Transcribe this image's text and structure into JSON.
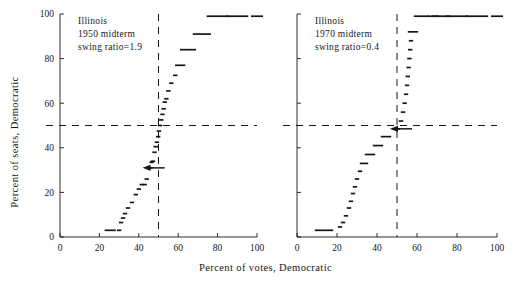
{
  "figure": {
    "xlabel": "Percent of votes, Democratic",
    "ylabel": "Percent of seats, Democratic",
    "ink_color": "#16161a",
    "background": "#ffffff"
  },
  "chart_data": [
    {
      "type": "scatter",
      "panel": "left",
      "title": "Illinois",
      "annotations": [
        "Illinois",
        "1950 midterm",
        "swing ratio=1.9"
      ],
      "xlabel": "Percent of votes, Democratic",
      "ylabel": "Percent of seats, Democratic",
      "xlim": [
        0,
        100
      ],
      "ylim": [
        0,
        100
      ],
      "xticks": [
        0,
        20,
        40,
        60,
        80,
        100
      ],
      "yticks": [
        0,
        20,
        40,
        60,
        80,
        100
      ],
      "grid": false,
      "legend": "none",
      "reference_lines": [
        {
          "orientation": "vertical",
          "value": 50,
          "style": "dashed"
        },
        {
          "orientation": "horizontal",
          "value": 50,
          "style": "dashed"
        }
      ],
      "marker_arrow": {
        "x": 45.5,
        "y": 31,
        "direction": "horizontal"
      },
      "x": [
        25.5,
        30.0,
        31.0,
        32.0,
        33.0,
        34.5,
        36.5,
        38.5,
        40.0,
        41.5,
        43.0,
        44.0,
        45.0,
        45.8,
        46.5,
        47.2,
        48.0,
        48.6,
        49.2,
        49.8,
        50.2,
        50.8,
        51.4,
        52.0,
        52.6,
        53.2,
        54.0,
        55.0,
        56.5,
        58.5,
        61.0,
        65.0,
        72.0,
        80.0,
        90.0,
        100.0
      ],
      "y": [
        3.0,
        3.0,
        6.5,
        8.5,
        10.5,
        13.0,
        15.5,
        19.0,
        21.5,
        23.5,
        23.5,
        26.0,
        31.0,
        31.0,
        33.5,
        34.0,
        38.0,
        40.5,
        42.5,
        45.0,
        47.5,
        50.0,
        52.5,
        55.0,
        57.5,
        60.5,
        62.0,
        65.5,
        69.0,
        72.5,
        77.0,
        84.0,
        91.0,
        99.0,
        99.0,
        99.0
      ]
    },
    {
      "type": "scatter",
      "panel": "right",
      "title": "Illinois",
      "annotations": [
        "Illinois",
        "1970 midterm",
        "swing ratio=0.4"
      ],
      "xlabel": "Percent of votes, Democratic",
      "ylabel": "Percent of seats, Democratic",
      "xlim": [
        0,
        100
      ],
      "ylim": [
        0,
        100
      ],
      "xticks": [
        0,
        20,
        40,
        60,
        80,
        100
      ],
      "yticks": [
        0,
        20,
        40,
        60,
        80,
        100
      ],
      "grid": false,
      "legend": "none",
      "reference_lines": [
        {
          "orientation": "vertical",
          "value": 50,
          "style": "dashed"
        },
        {
          "orientation": "horizontal",
          "value": 50,
          "style": "dashed"
        }
      ],
      "marker_arrow": {
        "x": 50.0,
        "y": 48.5,
        "direction": "horizontal"
      },
      "x": [
        13.5,
        21.5,
        23.0,
        24.5,
        26.0,
        27.0,
        28.0,
        29.0,
        30.0,
        31.5,
        33.5,
        36.5,
        40.5,
        44.5,
        48.5,
        50.5,
        52.0,
        53.0,
        53.8,
        54.5,
        55.0,
        55.4,
        55.8,
        56.2,
        56.6,
        57.0,
        58.0,
        62.0,
        68.0,
        72.0,
        80.0,
        90.0,
        100.0
      ],
      "y": [
        3.0,
        4.5,
        6.5,
        9.5,
        13.0,
        16.0,
        19.5,
        22.5,
        26.0,
        29.5,
        33.0,
        37.0,
        41.0,
        45.0,
        48.5,
        48.5,
        52.0,
        56.0,
        60.0,
        64.0,
        68.0,
        72.0,
        76.0,
        80.0,
        84.0,
        88.0,
        92.0,
        99.0,
        99.0,
        99.0,
        99.0,
        99.0,
        99.0
      ]
    }
  ]
}
